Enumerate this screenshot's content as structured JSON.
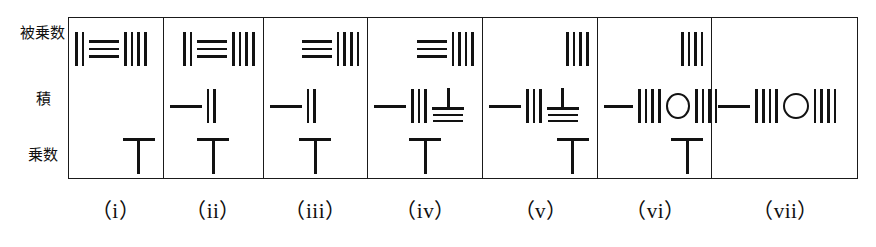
{
  "figure": {
    "script": "Japanese",
    "ink_color": "#121212",
    "background_color": "#ffffff"
  },
  "row_labels": {
    "multiplicand": "被乗数",
    "product": "積",
    "multiplier": "乗数"
  },
  "captions": [
    {
      "label": "（i）"
    },
    {
      "label": "（ii）"
    },
    {
      "label": "（iii）"
    },
    {
      "label": "（iv）"
    },
    {
      "label": "（v）"
    },
    {
      "label": "（vi）"
    },
    {
      "label": "（vii）"
    }
  ],
  "panels": [
    {
      "id": "i",
      "multiplicand": {
        "reading": "234",
        "align": "left",
        "glyphs": [
          {
            "type": "vbars",
            "count": 2,
            "value": "2"
          },
          {
            "type": "hbars",
            "count": 3,
            "value": "3"
          },
          {
            "type": "vbars",
            "count": 4,
            "value": "4"
          }
        ]
      },
      "product": {
        "reading": "",
        "align": "right",
        "glyphs": []
      },
      "multiplier": {
        "reading": "6",
        "align": "right",
        "glyphs": [
          {
            "type": "tsym",
            "value": "6"
          }
        ]
      }
    },
    {
      "id": "ii",
      "multiplicand": {
        "reading": "234",
        "align": "right",
        "glyphs": [
          {
            "type": "vbars",
            "count": 2,
            "value": "2"
          },
          {
            "type": "hbars",
            "count": 3,
            "value": "3"
          },
          {
            "type": "vbars",
            "count": 4,
            "value": "4"
          }
        ]
      },
      "product": {
        "reading": "12",
        "align": "left",
        "glyphs": [
          {
            "type": "dash",
            "value": "1"
          },
          {
            "type": "vbars",
            "count": 2,
            "value": "2"
          }
        ]
      },
      "multiplier": {
        "reading": "6",
        "align": "center",
        "glyphs": [
          {
            "type": "tsym",
            "value": "6"
          }
        ]
      }
    },
    {
      "id": "iii",
      "multiplicand": {
        "reading": "34",
        "align": "right",
        "glyphs": [
          {
            "type": "hbars",
            "count": 3,
            "value": "3"
          },
          {
            "type": "vbars",
            "count": 4,
            "value": "4"
          }
        ]
      },
      "product": {
        "reading": "12",
        "align": "left",
        "glyphs": [
          {
            "type": "dash",
            "value": "1"
          },
          {
            "type": "vbars",
            "count": 2,
            "value": "2"
          }
        ]
      },
      "multiplier": {
        "reading": "6",
        "align": "center",
        "glyphs": [
          {
            "type": "tsym",
            "value": "6"
          }
        ]
      }
    },
    {
      "id": "iv",
      "multiplicand": {
        "reading": "34",
        "align": "right",
        "glyphs": [
          {
            "type": "hbars",
            "count": 3,
            "value": "3"
          },
          {
            "type": "vbars",
            "count": 4,
            "value": "4"
          }
        ]
      },
      "product": {
        "reading": "138",
        "align": "left",
        "glyphs": [
          {
            "type": "dash",
            "value": "1"
          },
          {
            "type": "vbars",
            "count": 3,
            "value": "3"
          },
          {
            "type": "usym",
            "value": "8"
          }
        ]
      },
      "multiplier": {
        "reading": "6",
        "align": "center",
        "glyphs": [
          {
            "type": "tsym",
            "value": "6"
          }
        ]
      }
    },
    {
      "id": "v",
      "multiplicand": {
        "reading": "4",
        "align": "right",
        "glyphs": [
          {
            "type": "vbars",
            "count": 4,
            "value": "4"
          }
        ]
      },
      "product": {
        "reading": "138",
        "align": "left",
        "glyphs": [
          {
            "type": "dash",
            "value": "1"
          },
          {
            "type": "vbars",
            "count": 3,
            "value": "3"
          },
          {
            "type": "usym",
            "value": "8"
          }
        ]
      },
      "multiplier": {
        "reading": "6",
        "align": "right",
        "glyphs": [
          {
            "type": "tsym",
            "value": "6"
          }
        ]
      }
    },
    {
      "id": "vi",
      "multiplicand": {
        "reading": "4",
        "align": "right",
        "glyphs": [
          {
            "type": "vbars",
            "count": 4,
            "value": "4"
          }
        ]
      },
      "product": {
        "reading": "1404",
        "align": "left",
        "glyphs": [
          {
            "type": "dash",
            "value": "1"
          },
          {
            "type": "vbars",
            "count": 4,
            "value": "4"
          },
          {
            "type": "zero",
            "value": "0"
          },
          {
            "type": "vbars",
            "count": 4,
            "value": "4"
          }
        ]
      },
      "multiplier": {
        "reading": "6",
        "align": "right",
        "glyphs": [
          {
            "type": "tsym",
            "value": "6"
          }
        ]
      }
    },
    {
      "id": "vii",
      "multiplicand": {
        "reading": "",
        "align": "right",
        "glyphs": []
      },
      "product": {
        "reading": "1404",
        "align": "left",
        "glyphs": [
          {
            "type": "dash",
            "value": "1"
          },
          {
            "type": "vbars",
            "count": 4,
            "value": "4"
          },
          {
            "type": "zero",
            "value": "0"
          },
          {
            "type": "vbars",
            "count": 4,
            "value": "4"
          }
        ]
      },
      "multiplier": {
        "reading": "",
        "align": "center",
        "glyphs": []
      }
    }
  ]
}
